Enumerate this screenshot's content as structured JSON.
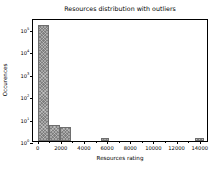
{
  "chart_data": {
    "type": "bar",
    "title": "Resources distribution with outliers",
    "xlabel": "Resources rating",
    "ylabel": "Occurences",
    "yscale": "log",
    "xlim": [
      -400,
      14800
    ],
    "ylim": [
      1,
      300000
    ],
    "grid": false,
    "legend": null,
    "bar_color": "#7f7f7f",
    "hatch": "xx",
    "bin_width": 950,
    "categories": [
      "0",
      "950",
      "1900",
      "5800",
      "13900"
    ],
    "x": [
      475,
      1425,
      2375,
      5800,
      13900
    ],
    "values": [
      150000,
      5,
      4,
      1,
      1
    ],
    "bins": [
      {
        "left": 0,
        "right": 950,
        "count": 150000
      },
      {
        "left": 950,
        "right": 1900,
        "count": 5
      },
      {
        "left": 1900,
        "right": 2850,
        "count": 4
      },
      {
        "left": 5450,
        "right": 6200,
        "count": 1
      },
      {
        "left": 13600,
        "right": 14350,
        "count": 1
      }
    ],
    "xticks": [
      0,
      2000,
      4000,
      6000,
      8000,
      10000,
      12000,
      14000
    ],
    "xtick_labels": [
      "0",
      "2000",
      "4000",
      "6000",
      "8000",
      "10000",
      "12000",
      "14000"
    ],
    "yticks": [
      1,
      10,
      100,
      1000,
      10000,
      100000
    ],
    "ytick_labels": [
      "10",
      "10",
      "10",
      "10",
      "10",
      "10"
    ],
    "ytick_exponents": [
      "0",
      "1",
      "2",
      "3",
      "4",
      "5"
    ]
  }
}
